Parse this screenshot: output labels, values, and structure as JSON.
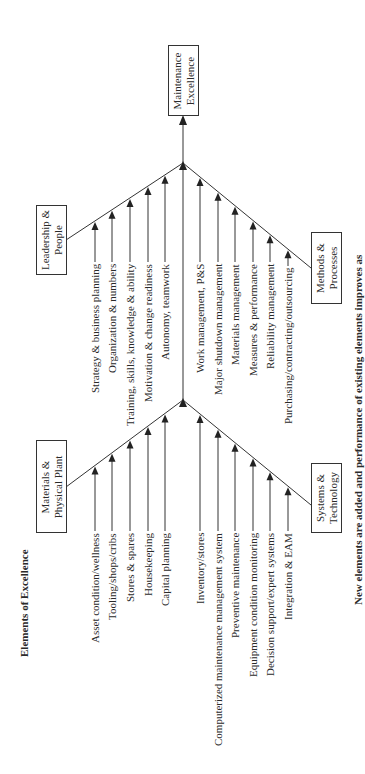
{
  "title": "Elements of Excellence",
  "goal": {
    "line1": "Maintenance",
    "line2": "Excellence"
  },
  "categories": [
    {
      "id": "leadership",
      "line1": "Leadership &",
      "line2": "People"
    },
    {
      "id": "methods",
      "line1": "Methods &",
      "line2": "Processes"
    },
    {
      "id": "materials",
      "line1": "Materials &",
      "line2": "Physical Plant"
    },
    {
      "id": "systems",
      "line1": "Systems &",
      "line2": "Technology"
    }
  ],
  "leadership_items": [
    "Strategy & business planning",
    "Organization & numbers",
    "Training, skills, knowledge & ability",
    "Motivation & change readiness",
    "Autonomy, teamwork"
  ],
  "methods_items": [
    "Work management, P&S",
    "Major shutdown management",
    "Materials management",
    "Measures & performance",
    "Reliability management",
    "Purchasing/contracting/outsourcing"
  ],
  "materials_items": [
    "Asset condition/wellness",
    "Tooling/shops/cribs",
    "Stores & spares",
    "Housekeeping",
    "Capital planning"
  ],
  "systems_items": [
    "Inventory/stores",
    "Computerized maintenance management system",
    "Preventive maintenance",
    "Equipment condition monitoring",
    "Decision support/expert systems",
    "Integration & EAM"
  ],
  "caption": "New elements are added and performance of existing elements improves as"
}
